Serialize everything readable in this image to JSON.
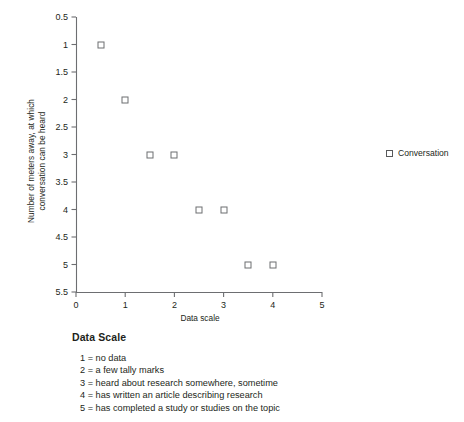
{
  "chart_data": {
    "type": "scatter",
    "title": "",
    "xlabel": "Data scale",
    "ylabel": "Number of meters away, at which\nconversation can be heard",
    "xlim": [
      0,
      5
    ],
    "ylim": [
      0.5,
      5.5
    ],
    "y_inverted": true,
    "grid": false,
    "legend_position": "right",
    "xticks": [
      "0",
      "1",
      "2",
      "3",
      "4",
      "5"
    ],
    "xtick_values": [
      0,
      1,
      2,
      3,
      4,
      5
    ],
    "yticks": [
      "0.5",
      "1",
      "1.5",
      "2",
      "2.5",
      "3",
      "3.5",
      "4",
      "4.5",
      "5",
      "5.5"
    ],
    "ytick_values": [
      0.5,
      1,
      1.5,
      2,
      2.5,
      3,
      3.5,
      4,
      4.5,
      5,
      5.5
    ],
    "series": [
      {
        "name": "Conversation",
        "marker": "open-square",
        "color": "#6d6e71",
        "points": [
          {
            "x": 0.5,
            "y": 1
          },
          {
            "x": 1.0,
            "y": 2
          },
          {
            "x": 1.5,
            "y": 3
          },
          {
            "x": 2.0,
            "y": 3
          },
          {
            "x": 2.5,
            "y": 4
          },
          {
            "x": 3.0,
            "y": 4
          },
          {
            "x": 3.5,
            "y": 5
          },
          {
            "x": 4.0,
            "y": 5
          }
        ]
      }
    ]
  },
  "legend": {
    "items": [
      {
        "label": "Conversation"
      }
    ]
  },
  "caption": {
    "title": "Data Scale",
    "items": [
      "1 = no data",
      "2 = a few tally marks",
      "3 = heard about research somewhere, sometime",
      "4 = has written an article describing research",
      "5 = has completed a study or studies on the topic"
    ]
  }
}
